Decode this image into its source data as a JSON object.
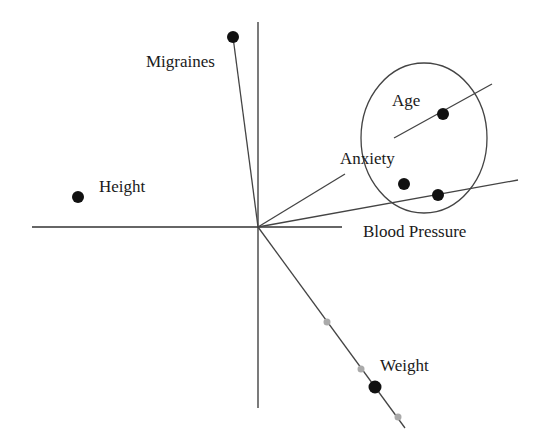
{
  "diagram": {
    "type": "biplot",
    "colors": {
      "axis": "#333333",
      "point": "#111111",
      "ghost_point": "#aaaaaa",
      "background": "#ffffff"
    },
    "variables": [
      {
        "name": "Migraines",
        "label": "Migraines"
      },
      {
        "name": "Height",
        "label": "Height"
      },
      {
        "name": "Age",
        "label": "Age"
      },
      {
        "name": "Anxiety",
        "label": "Anxiety"
      },
      {
        "name": "Blood Pressure",
        "label": "Blood Pressure"
      },
      {
        "name": "Weight",
        "label": "Weight"
      }
    ],
    "cluster": {
      "members": [
        "Age",
        "Anxiety",
        "Blood Pressure"
      ],
      "shape": "ellipse"
    },
    "weight_projection_points": 3
  }
}
